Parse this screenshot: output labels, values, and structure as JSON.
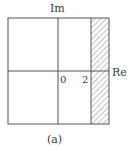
{
  "figure": {
    "caption": "(a)",
    "axes": {
      "real_label": "Re",
      "imag_label": "Im",
      "origin_label": "0",
      "tick_label": "2"
    },
    "region": {
      "description": "hatched vertical strip to the right of Re = 2",
      "fill": "diagonal-hatch"
    },
    "colors": {
      "line": "#555555",
      "hatch": "#777777",
      "background": "#ffffff"
    }
  }
}
